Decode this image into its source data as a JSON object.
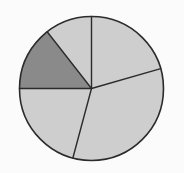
{
  "figure": {
    "width": 184,
    "height": 173,
    "background_color": "#fbfbfb",
    "title": "",
    "caption": ""
  },
  "chart_data": {
    "type": "pie",
    "title": "",
    "subtitle": "",
    "xlabel": "",
    "ylabel": "",
    "legend": false,
    "legend_position": "none",
    "grid": false,
    "labels_shown": false,
    "total_slices": 5,
    "highlighted_slice_index": 3,
    "start_angle_deg_from_top": 0,
    "direction": "clockwise",
    "categories": [
      "Slice 1",
      "Slice 2",
      "Slice 3",
      "Slice 4",
      "Slice 5"
    ],
    "values": [
      74,
      121,
      75,
      52,
      38
    ],
    "values_unit": "degrees",
    "percentages": [
      20.6,
      33.6,
      20.8,
      14.4,
      10.6
    ],
    "slice_colors": [
      "#cecece",
      "#cecece",
      "#cecece",
      "#8a8a8a",
      "#cecece"
    ],
    "slices": [
      {
        "index": 0,
        "label": "Slice 1",
        "start_angle_deg": 0,
        "end_angle_deg": 74,
        "sweep_deg": 74,
        "percent": 20.6,
        "fill": "#cecece",
        "highlighted": false
      },
      {
        "index": 1,
        "label": "Slice 2",
        "start_angle_deg": 74,
        "end_angle_deg": 195,
        "sweep_deg": 121,
        "percent": 33.6,
        "fill": "#cecece",
        "highlighted": false
      },
      {
        "index": 2,
        "label": "Slice 3",
        "start_angle_deg": 195,
        "end_angle_deg": 270,
        "sweep_deg": 75,
        "percent": 20.8,
        "fill": "#cecece",
        "highlighted": false
      },
      {
        "index": 3,
        "label": "Slice 4",
        "start_angle_deg": 270,
        "end_angle_deg": 322,
        "sweep_deg": 52,
        "percent": 14.4,
        "fill": "#8a8a8a",
        "highlighted": true
      },
      {
        "index": 4,
        "label": "Slice 5",
        "start_angle_deg": 322,
        "end_angle_deg": 360,
        "sweep_deg": 38,
        "percent": 10.6,
        "fill": "#cecece",
        "highlighted": false
      }
    ],
    "geometry": {
      "center_x": 91.5,
      "center_y": 88.5,
      "radius": 72.0,
      "outline_color": "#2b2b2b",
      "outline_width": 1.6,
      "divider_color": "#2b2b2b",
      "divider_width": 1.4
    }
  },
  "accessibility": {
    "alt_text": "Pie chart divided into five slices; one slice is shaded darker gray."
  }
}
